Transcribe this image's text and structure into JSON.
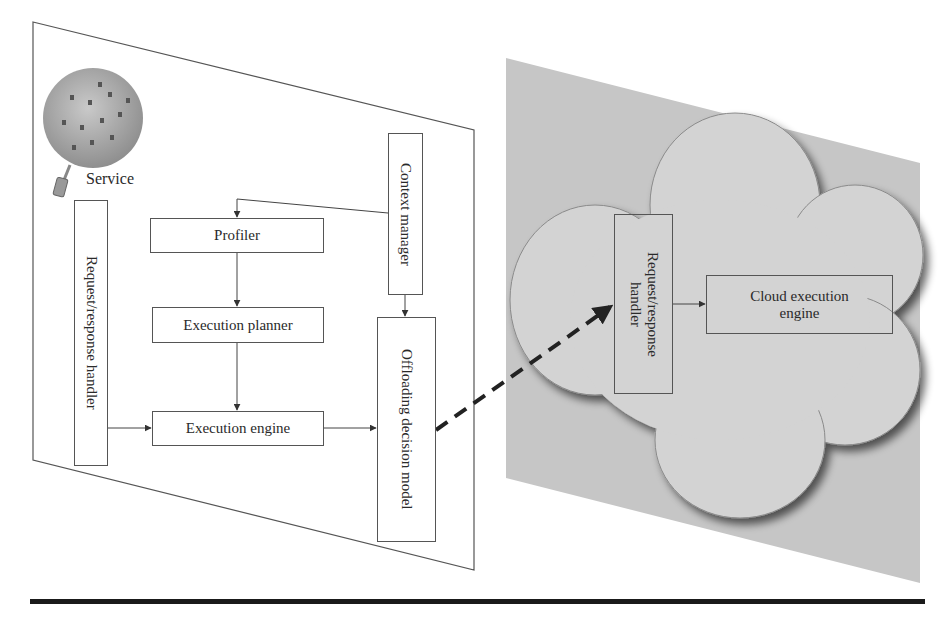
{
  "figure": {
    "device_panel": {
      "service_label": "Service",
      "components": {
        "request_response_handler": "Request/response handler",
        "profiler": "Profiler",
        "execution_planner": "Execution planner",
        "execution_engine": "Execution engine",
        "context_manager": "Context manager",
        "offloading_decision_model": "Offloading decision model"
      }
    },
    "cloud_panel": {
      "components": {
        "request_response_handler": "Request/response handler",
        "cloud_execution_engine": "Cloud execution engine"
      }
    },
    "connections": [
      {
        "from": "Context manager",
        "to": "Profiler"
      },
      {
        "from": "Context manager",
        "to": "Offloading decision model"
      },
      {
        "from": "Profiler",
        "to": "Execution planner"
      },
      {
        "from": "Execution planner",
        "to": "Execution engine"
      },
      {
        "from": "Request/response handler",
        "to": "Execution engine"
      },
      {
        "from": "Execution engine",
        "to": "Offloading decision model"
      },
      {
        "from": "Offloading decision model",
        "to": "Cloud Request/response handler",
        "style": "dashed"
      },
      {
        "from": "Cloud Request/response handler",
        "to": "Cloud execution engine"
      }
    ],
    "colors": {
      "panel_stroke": "#555555",
      "cloud_panel_fill": "#c8c8c8",
      "cloud_fill": "#d4d4d4",
      "rule": "#1a1a1a"
    }
  }
}
